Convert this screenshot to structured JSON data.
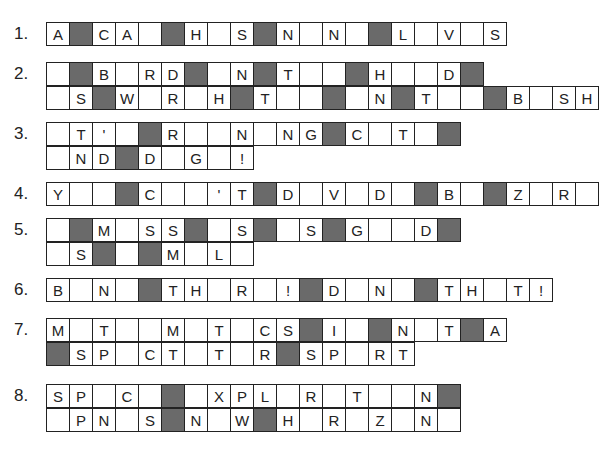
{
  "puzzles": [
    {
      "number": "1.",
      "rows": [
        [
          "A",
          "#",
          "C",
          "A",
          "",
          "#",
          "H",
          "",
          "S",
          "#",
          "N",
          "",
          "N",
          "",
          "#",
          "L",
          "",
          "V",
          "",
          "S"
        ]
      ]
    },
    {
      "number": "2.",
      "rows": [
        [
          "",
          "#",
          "B",
          "",
          "R",
          "D",
          "#",
          "",
          "N",
          "#",
          "T",
          "",
          "",
          "#",
          "H",
          "",
          "",
          "D",
          "#"
        ],
        [
          "",
          "S",
          "#",
          "W",
          "",
          "R",
          "",
          "H",
          "#",
          "T",
          "",
          "",
          "#",
          "",
          "N",
          "#",
          "T",
          "",
          "",
          "#",
          "B",
          "",
          "S",
          "H"
        ]
      ]
    },
    {
      "number": "3.",
      "rows": [
        [
          "",
          "T",
          "'",
          "",
          "#",
          "R",
          "",
          "",
          "N",
          "",
          "N",
          "G",
          "#",
          "C",
          "",
          "T",
          "",
          "#"
        ],
        [
          "",
          "N",
          "D",
          "#",
          "D",
          "",
          "G",
          "",
          "!"
        ]
      ]
    },
    {
      "number": "4.",
      "rows": [
        [
          "Y",
          "",
          "",
          "#",
          "C",
          "",
          "",
          "'",
          "T",
          "#",
          "D",
          "",
          "V",
          "",
          "D",
          "",
          "#",
          "B",
          "",
          "#",
          "Z",
          "",
          "R",
          ""
        ]
      ]
    },
    {
      "number": "5.",
      "rows": [
        [
          "",
          "#",
          "M",
          "",
          "S",
          "S",
          "#",
          "",
          "S",
          "#",
          "",
          "S",
          "#",
          "G",
          "",
          "",
          "D",
          "#"
        ],
        [
          "",
          "S",
          "#",
          "",
          "#",
          "M",
          "",
          "L",
          ""
        ]
      ]
    },
    {
      "number": "6.",
      "rows": [
        [
          "B",
          "",
          "N",
          "",
          "#",
          "T",
          "H",
          "",
          "R",
          "",
          "!",
          "#",
          "D",
          "",
          "N",
          "",
          "#",
          "T",
          "H",
          "",
          "T",
          "!"
        ]
      ]
    },
    {
      "number": "7.",
      "rows": [
        [
          "M",
          "",
          "T",
          "",
          "",
          "M",
          "",
          "T",
          "",
          "C",
          "S",
          "#",
          "I",
          "",
          "#",
          "N",
          "",
          "T",
          "#",
          "A"
        ],
        [
          "#",
          "S",
          "P",
          "",
          "C",
          "T",
          "",
          "T",
          "",
          "R",
          "#",
          "S",
          "P",
          "",
          "R",
          "T"
        ]
      ]
    },
    {
      "number": "8.",
      "rows": [
        [
          "S",
          "P",
          "",
          "C",
          "",
          "#",
          "",
          "X",
          "P",
          "L",
          "",
          "R",
          "",
          "T",
          "",
          "",
          "N",
          "#"
        ],
        [
          "",
          "P",
          "N",
          "",
          "S",
          "#",
          "N",
          "",
          "W",
          "#",
          "H",
          "",
          "R",
          "",
          "Z",
          "",
          "N",
          ""
        ]
      ]
    }
  ]
}
